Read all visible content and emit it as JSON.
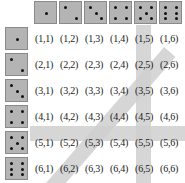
{
  "figure": {
    "name": "two-dice-sample-space"
  },
  "dice_faces": {
    "one": 1,
    "two": 2,
    "three": 3,
    "four": 4,
    "five": 5,
    "six": 6
  },
  "header_row": {
    "name": "column-headers",
    "dice": [
      {
        "value": 1,
        "icon": "die-face-1-icon",
        "pips": [
          "mm"
        ]
      },
      {
        "value": 2,
        "icon": "die-face-2-icon",
        "pips": [
          "tl",
          "br"
        ]
      },
      {
        "value": 3,
        "icon": "die-face-3-icon",
        "pips": [
          "tl",
          "mm",
          "br"
        ]
      },
      {
        "value": 4,
        "icon": "die-face-4-icon",
        "pips": [
          "tl",
          "tr",
          "bl",
          "br"
        ]
      },
      {
        "value": 5,
        "icon": "die-face-5-icon",
        "pips": [
          "tl",
          "tr",
          "mm",
          "bl",
          "br"
        ]
      },
      {
        "value": 6,
        "icon": "die-face-6-icon",
        "pips": [
          "tl",
          "tr",
          "ml",
          "mr",
          "bl",
          "br"
        ]
      }
    ]
  },
  "header_col": {
    "name": "row-headers",
    "dice": [
      {
        "value": 1,
        "icon": "die-face-1-icon",
        "pips": [
          "mm"
        ]
      },
      {
        "value": 2,
        "icon": "die-face-2-icon",
        "pips": [
          "tl",
          "br"
        ]
      },
      {
        "value": 3,
        "icon": "die-face-3-icon",
        "pips": [
          "tl",
          "mm",
          "br"
        ]
      },
      {
        "value": 4,
        "icon": "die-face-4-icon",
        "pips": [
          "tl",
          "tr",
          "bl",
          "br"
        ]
      },
      {
        "value": 5,
        "icon": "die-face-5-icon",
        "pips": [
          "tl",
          "tr",
          "mm",
          "bl",
          "br"
        ]
      },
      {
        "value": 6,
        "icon": "die-face-6-icon",
        "pips": [
          "tl",
          "tr",
          "ml",
          "mr",
          "bl",
          "br"
        ]
      }
    ]
  },
  "grid": {
    "rows": 6,
    "cols": 6,
    "cells": [
      [
        "(1,1)",
        "(1,2)",
        "(1,3)",
        "(1,4)",
        "(1,5)",
        "(1,6)"
      ],
      [
        "(2,1)",
        "(2,2)",
        "(2,3)",
        "(2,4)",
        "(2,5)",
        "(2,6)"
      ],
      [
        "(3,1)",
        "(3,2)",
        "(3,3)",
        "(3,4)",
        "(3,5)",
        "(3,6)"
      ],
      [
        "(4,1)",
        "(4,2)",
        "(4,3)",
        "(4,4)",
        "(4,5)",
        "(4,6)"
      ],
      [
        "(5,1)",
        "(5,2)",
        "(5,3)",
        "(5,4)",
        "(5,5)",
        "(5,6)"
      ],
      [
        "(6,1)",
        "(6,2)",
        "(6,3)",
        "(6,4)",
        "(6,5)",
        "(6,6)"
      ]
    ]
  },
  "highlights": [
    {
      "name": "diagonal-sum-seven-band",
      "orientation": "diagonal",
      "cells": [
        "(1,6)",
        "(2,5)",
        "(3,4)",
        "(4,3)",
        "(5,2)",
        "(6,1)"
      ],
      "color": "#cfcfcf"
    },
    {
      "name": "column-five-band",
      "orientation": "vertical",
      "cells": [
        "(1,5)",
        "(2,5)",
        "(3,5)",
        "(4,5)",
        "(5,5)",
        "(6,5)"
      ],
      "color": "#cfcfcf"
    },
    {
      "name": "row-five-band",
      "orientation": "horizontal",
      "cells": [
        "(5,1)",
        "(5,2)",
        "(5,3)",
        "(5,4)",
        "(5,5)",
        "(5,6)"
      ],
      "color": "#cfcfcf"
    }
  ],
  "colors": {
    "die_face": "#b4b4b4",
    "die_border": "#8a8a8a",
    "pip": "#111111",
    "highlight": "#cfcfcf",
    "text": "#1a1a1a",
    "background": "#ffffff"
  }
}
